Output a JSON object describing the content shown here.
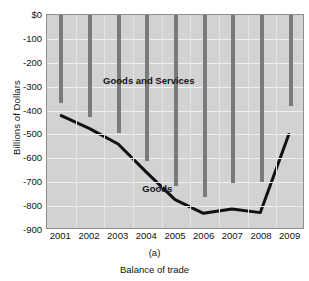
{
  "chart_data": {
    "type": "bar",
    "title": "",
    "subtitle": "",
    "panel_letter": "(a)",
    "xlabel": "Balance of trade",
    "ylabel": "Billions of Dollars",
    "categories": [
      "2001",
      "2002",
      "2003",
      "2004",
      "2005",
      "2006",
      "2007",
      "2008",
      "2009"
    ],
    "x": [
      2001,
      2002,
      2003,
      2004,
      2005,
      2006,
      2007,
      2008,
      2009
    ],
    "ylim": [
      -900,
      0
    ],
    "xlim": [
      2000.5,
      2009.5
    ],
    "grid": true,
    "legend": "inline-annotations",
    "y_ticks": [
      0,
      -100,
      -200,
      -300,
      -400,
      -500,
      -600,
      -700,
      -800,
      -900
    ],
    "y_tick_labels": [
      "$0",
      "-100",
      "-200",
      "-300",
      "-400",
      "-500",
      "-600",
      "-700",
      "-800",
      "-900"
    ],
    "series": [
      {
        "name": "Goods and Services",
        "type": "bar",
        "color": "#7a7a7a",
        "values": [
          -368,
          -425,
          -495,
          -610,
          -715,
          -762,
          -705,
          -700,
          -380
        ]
      },
      {
        "name": "Goods",
        "type": "line",
        "color": "#111111",
        "values": [
          -425,
          -480,
          -545,
          -665,
          -780,
          -838,
          -820,
          -835,
          -505
        ]
      }
    ],
    "annotations": [
      {
        "text": "Goods and Services",
        "x": 2004.05,
        "y": -270
      },
      {
        "text": "Goods",
        "x": 2004.35,
        "y": -723
      }
    ]
  },
  "figure": {
    "background": "#ffffff",
    "plot_background": "#d2d2d2",
    "grid_color": "#f0f0f0",
    "axis_color": "#8e8e8e"
  }
}
